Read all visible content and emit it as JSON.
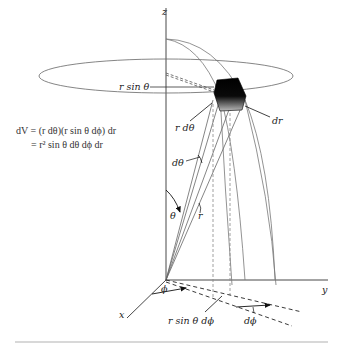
{
  "figure": {
    "axes": {
      "z": "z",
      "y": "y",
      "x": "x"
    },
    "labels": {
      "r_sin_theta": "r sin θ",
      "r_dtheta": "r dθ",
      "dr": "dr",
      "dtheta": "dθ",
      "theta": "θ",
      "r": "r",
      "phi": "ϕ",
      "r_sin_theta_dphi": "r sin θ dϕ",
      "dphi": "dϕ"
    },
    "equation": {
      "line1": "dV = (r dθ)(r sin θ dϕ) dr",
      "line2": "= r² sin θ dθ dϕ dr"
    },
    "colors": {
      "ink": "#222222",
      "curve": "#777777",
      "separator": "#d8d8d8",
      "cube": "#000000"
    }
  }
}
